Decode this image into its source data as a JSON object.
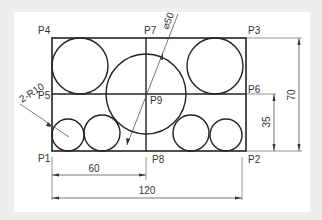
{
  "drawing": {
    "points": [
      {
        "id": "P1",
        "label": "P1",
        "x": 38,
        "y": 162
      },
      {
        "id": "P2",
        "label": "P2",
        "x": 248,
        "y": 162
      },
      {
        "id": "P3",
        "label": "P3",
        "x": 248,
        "y": 33
      },
      {
        "id": "P4",
        "label": "P4",
        "x": 38,
        "y": 33
      },
      {
        "id": "P5",
        "label": "P5",
        "x": 38,
        "y": 99
      },
      {
        "id": "P6",
        "label": "P6",
        "x": 248,
        "y": 91
      },
      {
        "id": "P7",
        "label": "P7",
        "x": 144,
        "y": 33
      },
      {
        "id": "P8",
        "label": "P8",
        "x": 152,
        "y": 162
      },
      {
        "id": "P9",
        "label": "P9",
        "x": 150,
        "y": 104
      }
    ],
    "dimensions": {
      "width_half": "60",
      "width_full": "120",
      "height_half": "35",
      "height_full": "70",
      "big_circle_diameter": "⌀50",
      "small_radius": "2-R10"
    },
    "colors": {
      "background": "#eeeeee",
      "paper": "#ffffff",
      "line": "#222222",
      "dim_line": "#555555"
    }
  }
}
